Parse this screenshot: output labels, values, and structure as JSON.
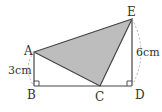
{
  "diagram": {
    "points": {
      "A": {
        "label": "A",
        "x": 34,
        "y": 52
      },
      "B": {
        "label": "B",
        "x": 34,
        "y": 86
      },
      "C": {
        "label": "C",
        "x": 100,
        "y": 86
      },
      "D": {
        "label": "D",
        "x": 132,
        "y": 86
      },
      "E": {
        "label": "E",
        "x": 132,
        "y": 19
      }
    },
    "dimensions": {
      "AB": "3cm",
      "ED": "6cm"
    },
    "shaded_triangle": "ACE",
    "colors": {
      "line": "#444444",
      "shade": "#bdbdbd",
      "dashed_arc": "#aaaaaa"
    }
  }
}
